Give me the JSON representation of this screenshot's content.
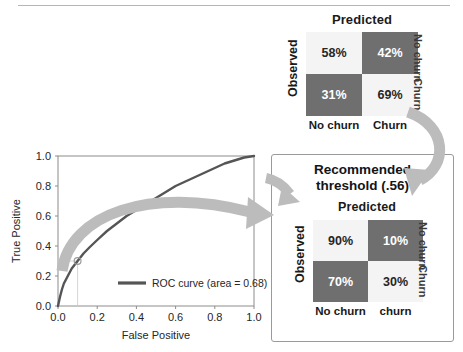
{
  "matrix_top": {
    "title": "Predicted",
    "observed_axis_label": "Observed",
    "column_labels": [
      "No churn",
      "Churn"
    ],
    "row_labels": [
      "No churn",
      "Churn"
    ],
    "cells": [
      {
        "value": "58%",
        "tone": "light"
      },
      {
        "value": "42%",
        "tone": "dark"
      },
      {
        "value": "31%",
        "tone": "dark"
      },
      {
        "value": "69%",
        "tone": "light"
      }
    ]
  },
  "threshold_panel": {
    "heading_line1": "Recommended",
    "heading_line2": "threshold (.56)"
  },
  "matrix_bottom": {
    "title": "Predicted",
    "observed_axis_label": "Observed",
    "column_labels": [
      "No churn",
      "churn"
    ],
    "row_labels": [
      "No churn",
      "Churn"
    ],
    "cells": [
      {
        "value": "90%",
        "tone": "light"
      },
      {
        "value": "10%",
        "tone": "dark"
      },
      {
        "value": "70%",
        "tone": "dark"
      },
      {
        "value": "30%",
        "tone": "light"
      }
    ]
  },
  "colors": {
    "cell_light": "#f4f4f4",
    "cell_dark": "#6f6f6f",
    "roc_line": "#555555",
    "arrow_gray": "#b9b9b9",
    "panel_border": "#9a9a9a"
  },
  "chart_data": {
    "type": "line",
    "title": "",
    "xlabel": "False Positive",
    "ylabel": "True Positive",
    "xlim": [
      0.0,
      1.0
    ],
    "ylim": [
      0.0,
      1.0
    ],
    "xticks": [
      "0.0",
      "0.2",
      "0.4",
      "0.6",
      "0.8",
      "1.0"
    ],
    "yticks": [
      "0.0",
      "0.2",
      "0.4",
      "0.6",
      "0.8",
      "1.0"
    ],
    "grid": false,
    "legend_position": "lower right",
    "legend": [
      "ROC curve (area = 0.68)"
    ],
    "auc": 0.68,
    "annotations": [
      {
        "name": "threshold-marker",
        "x": 0.1,
        "y": 0.3,
        "shape": "circle"
      }
    ],
    "series": [
      {
        "name": "ROC curve (area = 0.68)",
        "x": [
          0.0,
          0.01,
          0.02,
          0.03,
          0.05,
          0.07,
          0.1,
          0.13,
          0.16,
          0.2,
          0.25,
          0.3,
          0.35,
          0.4,
          0.45,
          0.5,
          0.55,
          0.6,
          0.65,
          0.7,
          0.75,
          0.8,
          0.85,
          0.9,
          0.95,
          1.0
        ],
        "y": [
          0.0,
          0.06,
          0.11,
          0.15,
          0.2,
          0.25,
          0.3,
          0.35,
          0.39,
          0.44,
          0.5,
          0.55,
          0.6,
          0.64,
          0.68,
          0.72,
          0.76,
          0.8,
          0.83,
          0.86,
          0.89,
          0.92,
          0.95,
          0.97,
          0.99,
          1.0
        ]
      }
    ]
  }
}
